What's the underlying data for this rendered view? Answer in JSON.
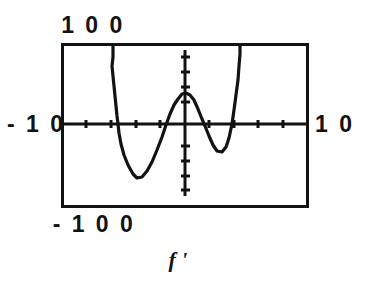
{
  "figure": {
    "caption": "f '",
    "caption_plain": "f'",
    "stroke_color": "#121212",
    "background_color": "#ffffff"
  },
  "labels": {
    "top": "1 0 0",
    "bottom": "- 1 0 0",
    "left": "- 1 0",
    "right": "1 0"
  },
  "chart_data": {
    "type": "line",
    "title": "f '",
    "xlabel": "",
    "ylabel": "",
    "xlim": [
      -10,
      10
    ],
    "ylim": [
      -100,
      100
    ],
    "grid": false,
    "legend": null,
    "axis_labels": {
      "x_min": "-10",
      "x_max": "10",
      "y_min": "-100",
      "y_max": "100"
    },
    "x_tick_interval": 1,
    "y_tick_interval": 10,
    "frame": {
      "x": 62,
      "y": 44,
      "width": 246,
      "height": 163
    },
    "axes_pixel": {
      "x_axis_y": 124,
      "y_axis_x": 185
    },
    "pixels_per_x_unit": 12.3,
    "features": [
      {
        "name": "left-asymptote-branch",
        "x": -5.9,
        "direction": "up-off-screen"
      },
      {
        "name": "left-local-minimum",
        "x": -3.9,
        "y": -33
      },
      {
        "name": "zero-crossing-1",
        "x": -1.9,
        "y": 0
      },
      {
        "name": "central-local-maximum",
        "x": 0.0,
        "y": 19
      },
      {
        "name": "zero-crossing-2",
        "x": 1.6,
        "y": 0
      },
      {
        "name": "right-local-minimum",
        "x": 3.0,
        "y": -17
      },
      {
        "name": "zero-crossing-3",
        "x": 3.8,
        "y": 0
      },
      {
        "name": "right-asymptote-branch",
        "x": 4.5,
        "direction": "up-off-screen"
      }
    ],
    "series": [
      {
        "name": "f'",
        "points_pixel": [
          [
            113,
            44
          ],
          [
            113,
            57
          ],
          [
            112,
            66
          ],
          [
            113,
            76
          ],
          [
            114,
            86
          ],
          [
            115,
            96
          ],
          [
            116,
            106
          ],
          [
            117,
            116
          ],
          [
            118,
            124
          ],
          [
            119,
            133
          ],
          [
            121,
            144
          ],
          [
            124,
            155
          ],
          [
            128,
            165
          ],
          [
            133,
            174
          ],
          [
            137,
            178
          ],
          [
            142,
            177
          ],
          [
            147,
            171
          ],
          [
            152,
            162
          ],
          [
            157,
            150
          ],
          [
            162,
            137
          ],
          [
            166,
            125
          ],
          [
            170,
            114
          ],
          [
            174,
            105
          ],
          [
            178,
            99
          ],
          [
            182,
            94
          ],
          [
            186,
            93
          ],
          [
            190,
            95
          ],
          [
            194,
            100
          ],
          [
            198,
            109
          ],
          [
            202,
            119
          ],
          [
            205,
            126
          ],
          [
            209,
            136
          ],
          [
            213,
            145
          ],
          [
            217,
            151
          ],
          [
            222,
            152
          ],
          [
            226,
            147
          ],
          [
            229,
            138
          ],
          [
            232,
            124
          ],
          [
            234,
            110
          ],
          [
            236,
            95
          ],
          [
            238,
            80
          ],
          [
            239,
            66
          ],
          [
            240,
            54
          ],
          [
            240,
            44
          ]
        ]
      }
    ]
  }
}
